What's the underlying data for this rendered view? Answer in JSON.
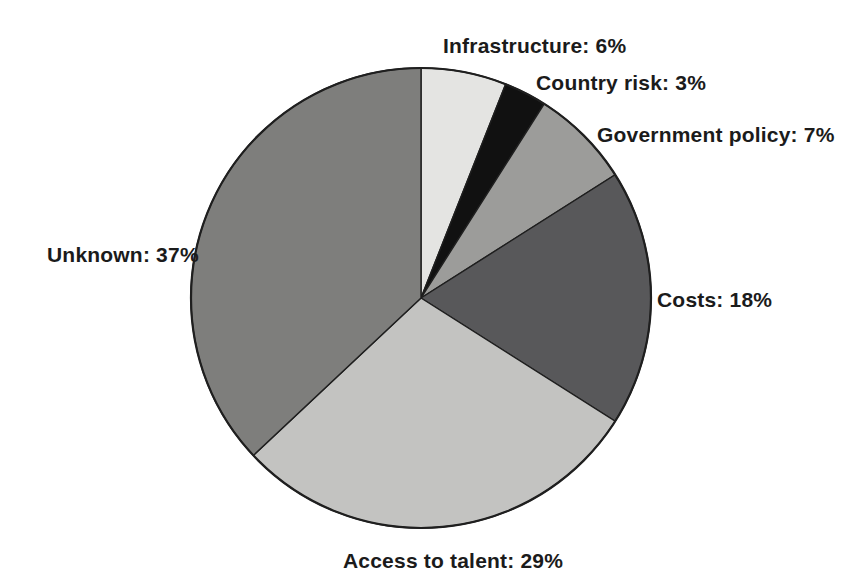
{
  "chart_data": {
    "type": "pie",
    "title": "",
    "categories": [
      "Infrastructure",
      "Country risk",
      "Government policy",
      "Costs",
      "Access to talent",
      "Unknown"
    ],
    "values": [
      6,
      3,
      7,
      18,
      29,
      37
    ],
    "unit": "%",
    "labels": [
      "Infrastructure: 6%",
      "Country risk: 3%",
      "Government policy: 7%",
      "Costs: 18%",
      "Access to talent: 29%",
      "Unknown: 37%"
    ],
    "colors": [
      "#e4e4e2",
      "#111111",
      "#9c9c9a",
      "#58585a",
      "#c3c3c1",
      "#7e7e7c"
    ],
    "stroke_color": "#1f1f1f",
    "start_angle_deg": 0,
    "direction": "clockwise",
    "legend": "none",
    "label_placement": "outside"
  },
  "page": {
    "background": "#ffffff"
  }
}
